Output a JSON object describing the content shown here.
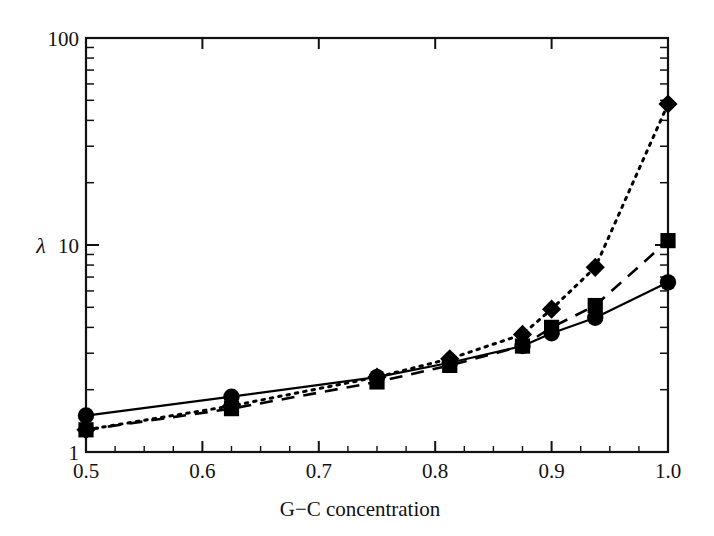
{
  "chart_data": {
    "type": "line",
    "title": "",
    "xlabel": "G−C concentration",
    "ylabel": "λ",
    "xlim": [
      0.5,
      1.0
    ],
    "ylim": [
      1,
      100
    ],
    "yscale": "log",
    "xscale": "linear",
    "grid": false,
    "legend": "none",
    "frame": "box",
    "x": [
      0.5,
      0.625,
      0.75,
      0.8125,
      0.875,
      0.9,
      0.9375,
      1.0
    ],
    "xticks": [
      0.5,
      0.6,
      0.7,
      0.8,
      0.9,
      1.0
    ],
    "xtick_labels": [
      "0.5",
      "0.6",
      "0.7",
      "0.8",
      "0.9",
      "1.0"
    ],
    "yticks": [
      1,
      10,
      100
    ],
    "ytick_labels": [
      "1",
      "10",
      "100"
    ],
    "series": [
      {
        "name": "circles",
        "marker": "circle",
        "linestyle": "solid",
        "color": "#000000",
        "values": [
          1.5,
          1.85,
          2.3,
          2.7,
          3.25,
          3.75,
          4.45,
          6.6
        ]
      },
      {
        "name": "squares",
        "marker": "square",
        "linestyle": "dashed",
        "color": "#000000",
        "values": [
          1.28,
          1.62,
          2.18,
          2.62,
          3.25,
          4.0,
          5.1,
          10.5
        ]
      },
      {
        "name": "diamonds",
        "marker": "diamond",
        "linestyle": "dotted",
        "color": "#000000",
        "values": [
          1.28,
          1.67,
          2.3,
          2.82,
          3.7,
          4.9,
          7.8,
          48.0
        ]
      }
    ]
  },
  "axes": {
    "x_title": "G−C concentration",
    "y_symbol": "λ",
    "x_tick_labels": [
      "0.5",
      "0.6",
      "0.7",
      "0.8",
      "0.9",
      "1.0"
    ],
    "y_tick_labels": [
      "100",
      "10",
      "1"
    ]
  },
  "style": {
    "axis_color": "#111111",
    "background": "#ffffff",
    "marker_color": "#000000"
  }
}
